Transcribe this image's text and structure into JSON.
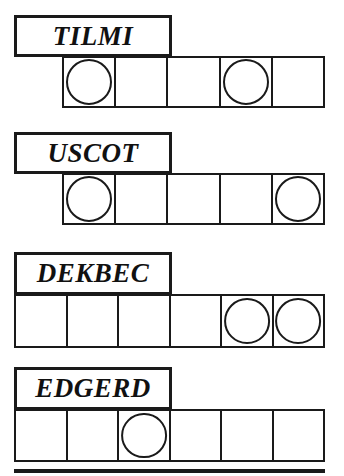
{
  "page": {
    "kind": "word-shape-worksheet",
    "background_color": "#ffffff",
    "ink_color": "#1a1a1a",
    "width": 344,
    "height": 476
  },
  "rows": [
    {
      "label": "TILMI",
      "label_box": {
        "x": 14,
        "y": 15,
        "width": 158,
        "height": 42
      },
      "label_font_size": 27,
      "strip": {
        "x": 62,
        "y": 56,
        "width": 263,
        "height": 52
      },
      "cell_count": 5,
      "circle_cells": [
        1,
        4
      ]
    },
    {
      "label": "USCOT",
      "label_box": {
        "x": 14,
        "y": 132,
        "width": 158,
        "height": 42
      },
      "label_font_size": 27,
      "strip": {
        "x": 62,
        "y": 173,
        "width": 263,
        "height": 52
      },
      "cell_count": 5,
      "circle_cells": [
        1,
        5
      ]
    },
    {
      "label": "DEKBEC",
      "label_box": {
        "x": 14,
        "y": 252,
        "width": 158,
        "height": 43
      },
      "label_font_size": 27,
      "strip": {
        "x": 14,
        "y": 294,
        "width": 311,
        "height": 54
      },
      "cell_count": 6,
      "circle_cells": [
        5,
        6
      ]
    },
    {
      "label": "EDGERD",
      "label_box": {
        "x": 14,
        "y": 367,
        "width": 158,
        "height": 43
      },
      "label_font_size": 27,
      "strip": {
        "x": 14,
        "y": 409,
        "width": 311,
        "height": 53
      },
      "cell_count": 6,
      "circle_cells": [
        3
      ]
    }
  ],
  "next_row_edge": {
    "x": 14,
    "y": 469,
    "width": 311,
    "height": 4
  }
}
